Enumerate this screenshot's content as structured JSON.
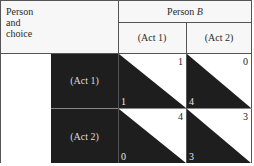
{
  "header": {
    "corner_label": [
      "Person",
      "and",
      "choice"
    ],
    "column_player": "Person B",
    "column_player_name": "Person",
    "column_player_letter": "B",
    "columns": [
      "(Act 1)",
      "(Act 2)"
    ]
  },
  "rows": {
    "row_player_name": "Person",
    "row_player_letter": "A",
    "labels": [
      "(Act 1)",
      "(Act 2)"
    ]
  },
  "payoffs": [
    [
      {
        "person_a": 1,
        "person_b": 1
      },
      {
        "person_a": 4,
        "person_b": 0
      }
    ],
    [
      {
        "person_a": 0,
        "person_b": 4
      },
      {
        "person_a": 3,
        "person_b": 3
      }
    ]
  ],
  "cells": {
    "r0c0": {
      "top_right": "1",
      "bottom_left": "1"
    },
    "r0c1": {
      "top_right": "0",
      "bottom_left": "4"
    },
    "r1c0": {
      "top_right": "4",
      "bottom_left": "0"
    },
    "r1c1": {
      "top_right": "3",
      "bottom_left": "3"
    }
  },
  "colors": {
    "dark_fill": "#1e1e1e",
    "light_fill": "#ffffff",
    "rule": "#555555"
  }
}
